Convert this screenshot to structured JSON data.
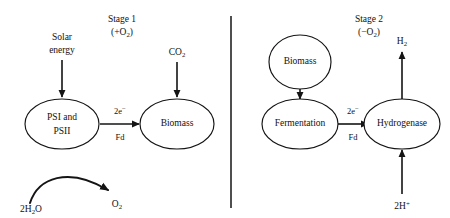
{
  "figure": {
    "background_color": "#ffffff",
    "stroke_color": "#141414"
  },
  "stages": [
    {
      "id": "stage-1",
      "name": "Stage 1",
      "condition": "(+O₂)",
      "condition_sign": "+",
      "condition_species": "O",
      "condition_subscript": "2"
    },
    {
      "id": "stage-2",
      "name": "Stage 2",
      "condition": "(−O₂)",
      "condition_sign": "−",
      "condition_species": "O",
      "condition_subscript": "2"
    }
  ],
  "stage1": {
    "inputs": [
      {
        "id": "solar-energy",
        "line1": "Solar",
        "line2": "energy"
      },
      {
        "id": "carbon-dioxide",
        "species": "CO",
        "subscript": "2"
      }
    ],
    "nodes": [
      {
        "id": "psi-psii",
        "line1": "PSI and",
        "line2": "PSII"
      },
      {
        "id": "biomass",
        "line1": "Biomass",
        "line2": ""
      }
    ],
    "edge": {
      "id": "electron-transfer-1",
      "above": "2e⁻",
      "above_base": "2e",
      "above_sup": "−",
      "below": "Fd"
    },
    "water_split": {
      "reactant_prefix": "2H",
      "reactant_sub": "2",
      "reactant_suffix": "O",
      "reactant_full": "2H₂O",
      "product_species": "O",
      "product_sub": "2",
      "product_full": "O₂"
    }
  },
  "stage2": {
    "nodes": [
      {
        "id": "biomass-2",
        "label": "Biomass"
      },
      {
        "id": "fermentation",
        "label": "Fermentation"
      },
      {
        "id": "hydrogenase",
        "label": "Hydrogenase"
      }
    ],
    "edge": {
      "id": "electron-transfer-2",
      "above": "2e⁻",
      "above_base": "2e",
      "above_sup": "−",
      "below": "Fd"
    },
    "output": {
      "id": "hydrogen-gas",
      "species": "H",
      "subscript": "2",
      "full": "H₂"
    },
    "input": {
      "id": "proton",
      "prefix": "2H",
      "superscript": "+",
      "full": "2H⁺"
    }
  }
}
